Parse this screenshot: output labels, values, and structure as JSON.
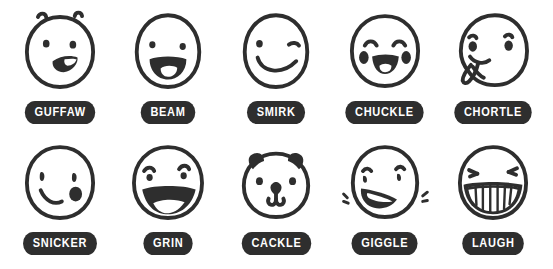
{
  "sheet": {
    "title": "Laughter Emoji Icon Sheet",
    "background_color": "#ffffff",
    "ink_color": "#2e2e2e",
    "pill_color": "#2e2e2e",
    "pill_text_color": "#ffffff",
    "columns": 5,
    "rows": 2
  },
  "icons": [
    {
      "label": "GUFFAW",
      "icon_name": "guffaw-face-icon",
      "row": 1,
      "column": 1,
      "features": "round face, two raised eyebrow arcs, two dot eyes, open filled mouth with white tooth highlight"
    },
    {
      "label": "BEAM",
      "icon_name": "beam-face-icon",
      "row": 1,
      "column": 2,
      "features": "oval face, two dot eyes, wide open filled mouth with white tongue"
    },
    {
      "label": "SMIRK",
      "icon_name": "smirk-face-icon",
      "row": 1,
      "column": 3,
      "features": "oval face, one dot eye, one winking line eye, curved smirk line"
    },
    {
      "label": "CHUCKLE",
      "icon_name": "chuckle-face-icon",
      "row": 1,
      "column": 4,
      "features": "round face, two arched closed eyes, two oval blush cheeks, filled smile with white tongue"
    },
    {
      "label": "CHORTLE",
      "icon_name": "chortle-face-icon",
      "row": 1,
      "column": 5,
      "features": "round face, two oval eyes with brow strokes, tongue sticking out of lower-left mouth"
    },
    {
      "label": "SNICKER",
      "icon_name": "snicker-face-icon",
      "row": 2,
      "column": 1,
      "features": "round face, two comma eyes, small curved smile line, filled blob at right cheek"
    },
    {
      "label": "GRIN",
      "icon_name": "grin-face-icon",
      "row": 2,
      "column": 2,
      "features": "round face, two dot eyes with arched brows, very wide open mouth with white tongue"
    },
    {
      "label": "CACKLE",
      "icon_name": "cackle-bear-face-icon",
      "row": 2,
      "column": 3,
      "features": "bear face with two ears, two dot eyes, triangular nose, W-shaped muzzle mouth"
    },
    {
      "label": "GIGGLE",
      "icon_name": "giggle-face-icon",
      "row": 2,
      "column": 4,
      "features": "round face, two small eyes with brows, angled open mouth, motion shake lines on both sides"
    },
    {
      "label": "LAUGH",
      "icon_name": "laugh-face-icon",
      "row": 2,
      "column": 5,
      "features": "round face, two squinting X eyes, wide toothy grin with vertical tooth lines"
    }
  ]
}
